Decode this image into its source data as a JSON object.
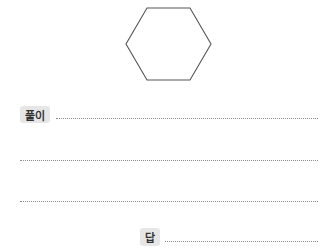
{
  "figure": {
    "shape": "regular-hexagon",
    "stroke_color": "#555555"
  },
  "solution": {
    "label": "풀이"
  },
  "answer": {
    "label": "답"
  },
  "colors": {
    "badge_bg": "#e6e6e6",
    "line": "#8a8a8a"
  }
}
